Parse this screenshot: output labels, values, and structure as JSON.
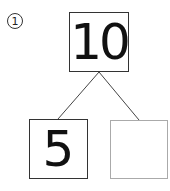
{
  "problem": {
    "label": "1",
    "whole": "10",
    "parts": [
      "5",
      ""
    ]
  },
  "colors": {
    "line": "#444444",
    "box_border": "#333333",
    "empty_box_border": "#aaaaaa"
  }
}
